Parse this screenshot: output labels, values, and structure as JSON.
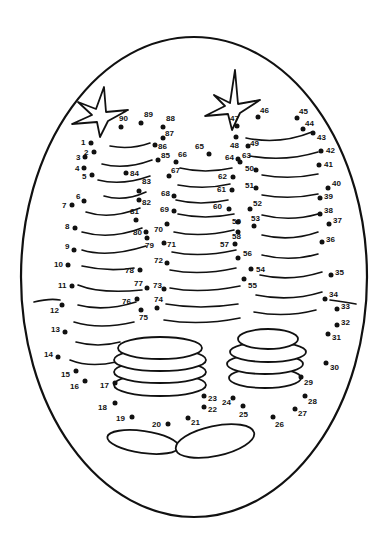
{
  "worksheet": {
    "type": "connect-the-dots",
    "subject": "stacks of coins with sparkles",
    "frame": "oval",
    "line_color": "#111111",
    "background": "#ffffff"
  },
  "dots": [
    {
      "n": "1",
      "x": 91,
      "y": 143,
      "lx": -10,
      "ly": -4
    },
    {
      "n": "2",
      "x": 94,
      "y": 152,
      "lx": -10,
      "ly": -3
    },
    {
      "n": "3",
      "x": 85,
      "y": 157,
      "lx": -9,
      "ly": -3
    },
    {
      "n": "4",
      "x": 84,
      "y": 168,
      "lx": -9,
      "ly": -3
    },
    {
      "n": "5",
      "x": 92,
      "y": 175,
      "lx": -10,
      "ly": -2
    },
    {
      "n": "6",
      "x": 84,
      "y": 201,
      "lx": -8,
      "ly": -8
    },
    {
      "n": "7",
      "x": 72,
      "y": 205,
      "lx": -10,
      "ly": -3
    },
    {
      "n": "8",
      "x": 75,
      "y": 228,
      "lx": -10,
      "ly": -5
    },
    {
      "n": "9",
      "x": 74,
      "y": 250,
      "lx": -9,
      "ly": -7
    },
    {
      "n": "10",
      "x": 68,
      "y": 265,
      "lx": -14,
      "ly": -4
    },
    {
      "n": "11",
      "x": 72,
      "y": 286,
      "lx": -14,
      "ly": -4
    },
    {
      "n": "12",
      "x": 62,
      "y": 305,
      "lx": -12,
      "ly": 2
    },
    {
      "n": "13",
      "x": 65,
      "y": 332,
      "lx": -14,
      "ly": -6
    },
    {
      "n": "14",
      "x": 58,
      "y": 357,
      "lx": -14,
      "ly": -6
    },
    {
      "n": "15",
      "x": 76,
      "y": 371,
      "lx": -15,
      "ly": 0
    },
    {
      "n": "16",
      "x": 85,
      "y": 381,
      "lx": -15,
      "ly": 2
    },
    {
      "n": "17",
      "x": 115,
      "y": 383,
      "lx": -15,
      "ly": -1
    },
    {
      "n": "18",
      "x": 115,
      "y": 403,
      "lx": -17,
      "ly": 1
    },
    {
      "n": "19",
      "x": 132,
      "y": 417,
      "lx": -16,
      "ly": -2
    },
    {
      "n": "20",
      "x": 168,
      "y": 424,
      "lx": -16,
      "ly": -3
    },
    {
      "n": "21",
      "x": 188,
      "y": 418,
      "lx": 3,
      "ly": 1
    },
    {
      "n": "22",
      "x": 204,
      "y": 407,
      "lx": 4,
      "ly": -1
    },
    {
      "n": "23",
      "x": 204,
      "y": 396,
      "lx": 4,
      "ly": -1
    },
    {
      "n": "24",
      "x": 233,
      "y": 398,
      "lx": -11,
      "ly": 1
    },
    {
      "n": "25",
      "x": 243,
      "y": 406,
      "lx": -4,
      "ly": 5
    },
    {
      "n": "26",
      "x": 273,
      "y": 417,
      "lx": 2,
      "ly": 4
    },
    {
      "n": "27",
      "x": 295,
      "y": 409,
      "lx": 3,
      "ly": 1
    },
    {
      "n": "28",
      "x": 305,
      "y": 396,
      "lx": 3,
      "ly": 2
    },
    {
      "n": "29",
      "x": 301,
      "y": 377,
      "lx": 3,
      "ly": 2
    },
    {
      "n": "30",
      "x": 326,
      "y": 363,
      "lx": 4,
      "ly": 1
    },
    {
      "n": "31",
      "x": 328,
      "y": 334,
      "lx": 4,
      "ly": 0
    },
    {
      "n": "32",
      "x": 337,
      "y": 325,
      "lx": 4,
      "ly": -6
    },
    {
      "n": "33",
      "x": 337,
      "y": 309,
      "lx": 4,
      "ly": -6
    },
    {
      "n": "34",
      "x": 325,
      "y": 299,
      "lx": 4,
      "ly": -8
    },
    {
      "n": "35",
      "x": 331,
      "y": 275,
      "lx": 4,
      "ly": -6
    },
    {
      "n": "36",
      "x": 322,
      "y": 242,
      "lx": 4,
      "ly": -6
    },
    {
      "n": "37",
      "x": 329,
      "y": 224,
      "lx": 4,
      "ly": -7
    },
    {
      "n": "38",
      "x": 320,
      "y": 214,
      "lx": 4,
      "ly": -7
    },
    {
      "n": "39",
      "x": 320,
      "y": 198,
      "lx": 4,
      "ly": -5
    },
    {
      "n": "40",
      "x": 328,
      "y": 188,
      "lx": 4,
      "ly": -8
    },
    {
      "n": "41",
      "x": 319,
      "y": 165,
      "lx": 5,
      "ly": -4
    },
    {
      "n": "42",
      "x": 321,
      "y": 151,
      "lx": 5,
      "ly": -4
    },
    {
      "n": "43",
      "x": 313,
      "y": 133,
      "lx": 4,
      "ly": 1
    },
    {
      "n": "44",
      "x": 303,
      "y": 129,
      "lx": 2,
      "ly": -9
    },
    {
      "n": "45",
      "x": 297,
      "y": 118,
      "lx": 2,
      "ly": -10
    },
    {
      "n": "46",
      "x": 258,
      "y": 117,
      "lx": 2,
      "ly": -10
    },
    {
      "n": "47",
      "x": 237,
      "y": 126,
      "lx": -7,
      "ly": -11
    },
    {
      "n": "48",
      "x": 236,
      "y": 137,
      "lx": -6,
      "ly": 5
    },
    {
      "n": "49",
      "x": 248,
      "y": 146,
      "lx": 2,
      "ly": -6
    },
    {
      "n": "50",
      "x": 256,
      "y": 170,
      "lx": -11,
      "ly": -5
    },
    {
      "n": "51",
      "x": 256,
      "y": 188,
      "lx": -11,
      "ly": -6
    },
    {
      "n": "52",
      "x": 250,
      "y": 209,
      "lx": 3,
      "ly": -9
    },
    {
      "n": "53",
      "x": 254,
      "y": 226,
      "lx": -3,
      "ly": -11
    },
    {
      "n": "54",
      "x": 251,
      "y": 269,
      "lx": 5,
      "ly": -3
    },
    {
      "n": "55",
      "x": 244,
      "y": 279,
      "lx": 4,
      "ly": 3
    },
    {
      "n": "56",
      "x": 238,
      "y": 258,
      "lx": 5,
      "ly": -8
    },
    {
      "n": "57",
      "x": 235,
      "y": 244,
      "lx": -15,
      "ly": -3
    },
    {
      "n": "58",
      "x": 238,
      "y": 232,
      "lx": -6,
      "ly": 1
    },
    {
      "n": "59",
      "x": 238,
      "y": 222,
      "lx": -6,
      "ly": -4
    },
    {
      "n": "60",
      "x": 229,
      "y": 209,
      "lx": -16,
      "ly": -6
    },
    {
      "n": "61",
      "x": 232,
      "y": 190,
      "lx": -15,
      "ly": -4
    },
    {
      "n": "62",
      "x": 233,
      "y": 177,
      "lx": -15,
      "ly": -4
    },
    {
      "n": "63",
      "x": 240,
      "y": 162,
      "lx": 2,
      "ly": -10
    },
    {
      "n": "64",
      "x": 238,
      "y": 159,
      "lx": -13,
      "ly": -5
    },
    {
      "n": "65",
      "x": 209,
      "y": 154,
      "lx": -14,
      "ly": -11
    },
    {
      "n": "66",
      "x": 176,
      "y": 162,
      "lx": 2,
      "ly": -11
    },
    {
      "n": "67",
      "x": 169,
      "y": 176,
      "lx": 2,
      "ly": -9
    },
    {
      "n": "68",
      "x": 174,
      "y": 196,
      "lx": -13,
      "ly": -6
    },
    {
      "n": "69",
      "x": 174,
      "y": 211,
      "lx": -14,
      "ly": -5
    },
    {
      "n": "70",
      "x": 167,
      "y": 224,
      "lx": -13,
      "ly": 2
    },
    {
      "n": "71",
      "x": 164,
      "y": 243,
      "lx": 3,
      "ly": -2
    },
    {
      "n": "72",
      "x": 167,
      "y": 263,
      "lx": -13,
      "ly": -6
    },
    {
      "n": "73",
      "x": 164,
      "y": 289,
      "lx": -11,
      "ly": -7
    },
    {
      "n": "74",
      "x": 157,
      "y": 308,
      "lx": -3,
      "ly": -12
    },
    {
      "n": "75",
      "x": 141,
      "y": 310,
      "lx": -2,
      "ly": 4
    },
    {
      "n": "76",
      "x": 137,
      "y": 299,
      "lx": -15,
      "ly": -1
    },
    {
      "n": "77",
      "x": 147,
      "y": 288,
      "lx": -13,
      "ly": -8
    },
    {
      "n": "78",
      "x": 140,
      "y": 270,
      "lx": -15,
      "ly": -3
    },
    {
      "n": "79",
      "x": 147,
      "y": 238,
      "lx": -2,
      "ly": 4
    },
    {
      "n": "80",
      "x": 146,
      "y": 232,
      "lx": -13,
      "ly": -3
    },
    {
      "n": "81",
      "x": 136,
      "y": 220,
      "lx": -6,
      "ly": -12
    },
    {
      "n": "82",
      "x": 139,
      "y": 200,
      "lx": 3,
      "ly": -1
    },
    {
      "n": "83",
      "x": 139,
      "y": 191,
      "lx": 3,
      "ly": -13
    },
    {
      "n": "84",
      "x": 126,
      "y": 173,
      "lx": 4,
      "ly": -3
    },
    {
      "n": "85",
      "x": 158,
      "y": 160,
      "lx": 3,
      "ly": -8
    },
    {
      "n": "86",
      "x": 155,
      "y": 145,
      "lx": 3,
      "ly": -2
    },
    {
      "n": "87",
      "x": 163,
      "y": 138,
      "lx": 2,
      "ly": -8
    },
    {
      "n": "88",
      "x": 163,
      "y": 127,
      "lx": 3,
      "ly": -12
    },
    {
      "n": "89",
      "x": 141,
      "y": 123,
      "lx": 3,
      "ly": -12
    },
    {
      "n": "90",
      "x": 121,
      "y": 127,
      "lx": -2,
      "ly": -12
    }
  ]
}
